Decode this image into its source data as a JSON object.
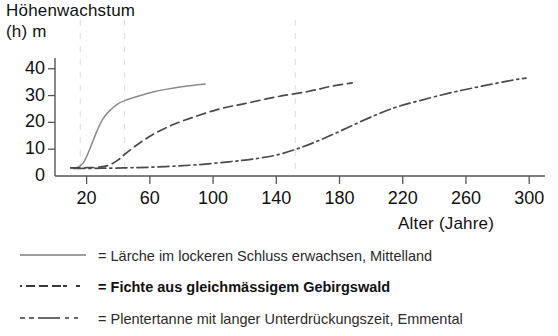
{
  "chart_data": {
    "type": "line",
    "title": "Höhenwachstum (h) m",
    "title_line1": "Höhenwachstum",
    "title_line2": "(h) m",
    "xlabel": "Alter (Jahre)",
    "ylabel": "(h) m",
    "xlim": [
      0,
      310
    ],
    "ylim": [
      0,
      44
    ],
    "xticks": [
      20,
      60,
      100,
      140,
      180,
      220,
      260,
      300
    ],
    "yticks": [
      0,
      10,
      20,
      30,
      40
    ],
    "grid": "faint vertical dashed gridlines at x = 16, 44 and 152",
    "gridlines_x": [
      16,
      44,
      152
    ],
    "legend_position": "below-plot",
    "series": [
      {
        "name": "Lärche im lockeren Schluss erwachsen, Mittelland",
        "style": "solid",
        "color": "#8a8a8a",
        "x": [
          10,
          14,
          18,
          22,
          26,
          30,
          34,
          40,
          46,
          54,
          62,
          70,
          80,
          90,
          95
        ],
        "y": [
          3,
          3.2,
          5,
          10,
          16,
          21,
          24,
          27,
          28.5,
          30,
          31.3,
          32.3,
          33.3,
          34,
          34.3
        ]
      },
      {
        "name": "Fichte aus gleichmässigem Gebirgswald",
        "style": "dashed",
        "color": "#4a4a4a",
        "x": [
          10,
          20,
          28,
          34,
          40,
          46,
          54,
          62,
          74,
          88,
          104,
          120,
          140,
          160,
          175,
          188
        ],
        "y": [
          3,
          3.1,
          3.3,
          4,
          6,
          9,
          12.5,
          15.5,
          19,
          22,
          25,
          27,
          29.5,
          31.5,
          33.5,
          34.7
        ]
      },
      {
        "name": "Plentertanne mit langer Unterdrückungszeit, Emmental",
        "style": "dashdot",
        "color": "#4a4a4a",
        "x": [
          12,
          30,
          50,
          70,
          90,
          110,
          125,
          140,
          155,
          170,
          185,
          200,
          215,
          230,
          250,
          270,
          290,
          298
        ],
        "y": [
          2.8,
          2.9,
          3.1,
          3.5,
          4.2,
          5.3,
          6.3,
          7.8,
          10.5,
          14,
          18,
          22,
          25.5,
          28,
          31,
          33.5,
          35.8,
          36.5
        ]
      }
    ]
  },
  "legend": {
    "equals": "=",
    "entries": [
      {
        "style": "solid",
        "label": "= Lärche im lockeren Schluss erwachsen, Mittelland"
      },
      {
        "style": "dashed",
        "label": "= Fichte aus gleichmässigem Gebirgswald"
      },
      {
        "style": "dashdot",
        "label": "= Plentertanne mit langer Unterdrückungszeit, Emmental"
      }
    ]
  },
  "colors": {
    "axis": "#5a5a5a",
    "grid": "#e2e2e2",
    "solid_series": "#8a8a8a",
    "dashed_series": "#4a4a4a",
    "dashdot_series": "#4a4a4a",
    "text": "#111111"
  }
}
